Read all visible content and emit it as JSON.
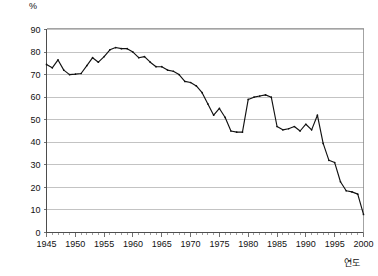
{
  "chart_data": {
    "type": "line",
    "title": "",
    "subtitle": "",
    "xlabel": "연도",
    "ylabel": "%",
    "unit_label": "%",
    "xlim": [
      1945,
      2000
    ],
    "ylim": [
      0,
      90
    ],
    "y_ticks": [
      0,
      10,
      20,
      30,
      40,
      50,
      60,
      70,
      80,
      90
    ],
    "x_ticks": [
      1945,
      1950,
      1955,
      1960,
      1965,
      1970,
      1975,
      1980,
      1985,
      1990,
      1995,
      2000
    ],
    "x_tick_labels": [
      "1945",
      "1950",
      "1955",
      "1960",
      "1965",
      "1970",
      "1975",
      "1980",
      "1985",
      "1990",
      "1995",
      "2000"
    ],
    "y_tick_labels": [
      "0",
      "10",
      "20",
      "30",
      "40",
      "50",
      "60",
      "70",
      "80",
      "90"
    ],
    "grid": "horizontal",
    "legend": "none",
    "legend_position": "none",
    "line_color": "#111111",
    "grid_color": "#aaaaaa",
    "axis_color": "#4d4d4d",
    "series": [
      {
        "name": "series-1",
        "x": [
          1945,
          1946,
          1947,
          1948,
          1949,
          1950,
          1951,
          1952,
          1953,
          1954,
          1955,
          1956,
          1957,
          1958,
          1959,
          1960,
          1961,
          1962,
          1963,
          1964,
          1965,
          1966,
          1967,
          1968,
          1969,
          1970,
          1971,
          1972,
          1973,
          1974,
          1975,
          1976,
          1977,
          1978,
          1979,
          1980,
          1981,
          1982,
          1983,
          1984,
          1985,
          1986,
          1987,
          1988,
          1989,
          1990,
          1991,
          1992,
          1993,
          1994,
          1995,
          1996,
          1997,
          1998,
          1999,
          2000
        ],
        "values": [
          74.5,
          73.0,
          76.5,
          72.0,
          70.0,
          70.2,
          70.5,
          74.0,
          77.5,
          75.5,
          78.0,
          81.0,
          82.0,
          81.5,
          81.5,
          80.0,
          77.5,
          78.0,
          75.5,
          73.5,
          73.5,
          72.0,
          71.5,
          70.0,
          67.0,
          66.5,
          65.0,
          62.0,
          57.0,
          52.0,
          55.0,
          51.0,
          45.0,
          44.5,
          44.5,
          59.0,
          60.0,
          60.5,
          61.0,
          60.0,
          47.0,
          45.5,
          46.0,
          47.0,
          45.0,
          48.0,
          45.5,
          52.0,
          39.5,
          32.0,
          31.0,
          22.5,
          18.5,
          18.0,
          17.0,
          8.0
        ]
      }
    ]
  }
}
